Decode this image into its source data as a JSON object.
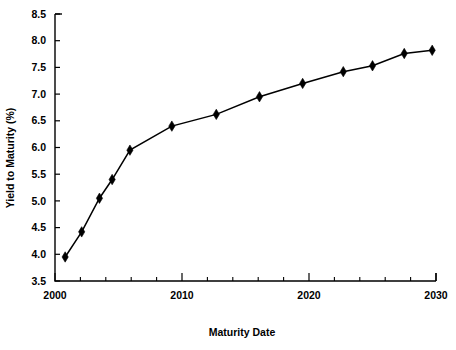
{
  "chart_data": {
    "type": "line",
    "title": "",
    "xlabel": "Maturity Date",
    "ylabel": "Yield to Maturity (%)",
    "xlim": [
      2000,
      2030
    ],
    "ylim": [
      3.5,
      8.5
    ],
    "grid": false,
    "legend": null,
    "marker": "diamond",
    "line_color": "#000000",
    "marker_color": "#000000",
    "x_tick_labels": [
      "2000",
      "2010",
      "2020",
      "2030"
    ],
    "x_tick_values": [
      2000,
      2010,
      2020,
      2030
    ],
    "x_minor_tick_values": [
      2002,
      2004,
      2006,
      2008,
      2012,
      2014,
      2016,
      2018,
      2022,
      2024,
      2026,
      2028
    ],
    "y_tick_labels": [
      "3.5",
      "4.0",
      "4.5",
      "5.0",
      "5.5",
      "6.0",
      "6.5",
      "7.0",
      "7.5",
      "8.0",
      "8.5"
    ],
    "y_tick_values": [
      3.5,
      4.0,
      4.5,
      5.0,
      5.5,
      6.0,
      6.5,
      7.0,
      7.5,
      8.0,
      8.5
    ],
    "series": [
      {
        "name": "Yield curve",
        "points": [
          {
            "x": 2000.8,
            "y": 3.95
          },
          {
            "x": 2002.1,
            "y": 4.42
          },
          {
            "x": 2003.5,
            "y": 5.05
          },
          {
            "x": 2004.5,
            "y": 5.4
          },
          {
            "x": 2005.9,
            "y": 5.95
          },
          {
            "x": 2009.2,
            "y": 6.4
          },
          {
            "x": 2012.7,
            "y": 6.62
          },
          {
            "x": 2016.1,
            "y": 6.95
          },
          {
            "x": 2019.5,
            "y": 7.2
          },
          {
            "x": 2022.7,
            "y": 7.42
          },
          {
            "x": 2025.0,
            "y": 7.53
          },
          {
            "x": 2027.5,
            "y": 7.76
          },
          {
            "x": 2029.7,
            "y": 7.82
          }
        ]
      }
    ]
  }
}
